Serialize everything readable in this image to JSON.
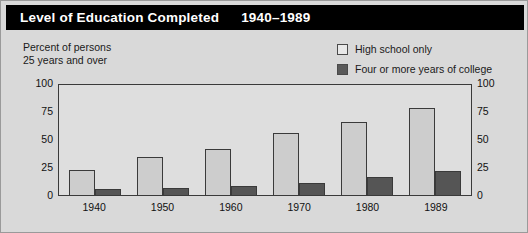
{
  "title": {
    "main": "Level of Education Completed",
    "years": "1940–1989"
  },
  "axis_caption": {
    "line1": "Percent of persons",
    "line2": "25 years and over"
  },
  "legend": {
    "items": [
      {
        "label": "High school only",
        "swatch": "light-gray-square",
        "color": "#cdcdcd"
      },
      {
        "label": "Four or more years of college",
        "swatch": "dark-gray-square",
        "color": "#555555"
      }
    ]
  },
  "colors": {
    "title_bar": "#000000",
    "background": "#d9d9d9",
    "plot_background": "#dedede",
    "high_school_bar": "#cdcdcd",
    "college_bar": "#555555",
    "axis": "#3a3a3a"
  },
  "chart_data": {
    "type": "bar",
    "title": "Level of Education Completed 1940–1989",
    "xlabel": "",
    "ylabel": "Percent of persons 25 years and over",
    "ylim": [
      0,
      100
    ],
    "yticks": [
      0,
      25,
      50,
      75,
      100
    ],
    "ytick_labels": [
      "0",
      "25",
      "50",
      "75",
      "100"
    ],
    "right_axis": true,
    "right_ytick_labels": [
      "0",
      "25",
      "50",
      "75",
      "100"
    ],
    "grid": false,
    "legend_position": "top-right",
    "categories": [
      "1940",
      "1950",
      "1960",
      "1970",
      "1980",
      "1989"
    ],
    "series": [
      {
        "name": "High school only",
        "values": [
          22,
          34,
          41,
          55,
          65,
          78
        ]
      },
      {
        "name": "Four or more years of college",
        "values": [
          5,
          6,
          8,
          11,
          16,
          21
        ]
      }
    ]
  }
}
